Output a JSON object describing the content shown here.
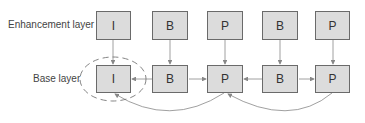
{
  "diagram": {
    "labels": {
      "enhancement": "Enhancement layer",
      "base": "Base layer"
    },
    "enhancement_frames": [
      {
        "type": "I"
      },
      {
        "type": "B"
      },
      {
        "type": "P"
      },
      {
        "type": "B"
      },
      {
        "type": "P"
      }
    ],
    "base_frames": [
      {
        "type": "I"
      },
      {
        "type": "B"
      },
      {
        "type": "P"
      },
      {
        "type": "B"
      },
      {
        "type": "P"
      }
    ],
    "highlight": "base-I-frame dashed ellipse",
    "colors": {
      "frame_fill": "#dcdcdc",
      "frame_border": "#6a6a6a",
      "arrow": "#888888"
    }
  }
}
